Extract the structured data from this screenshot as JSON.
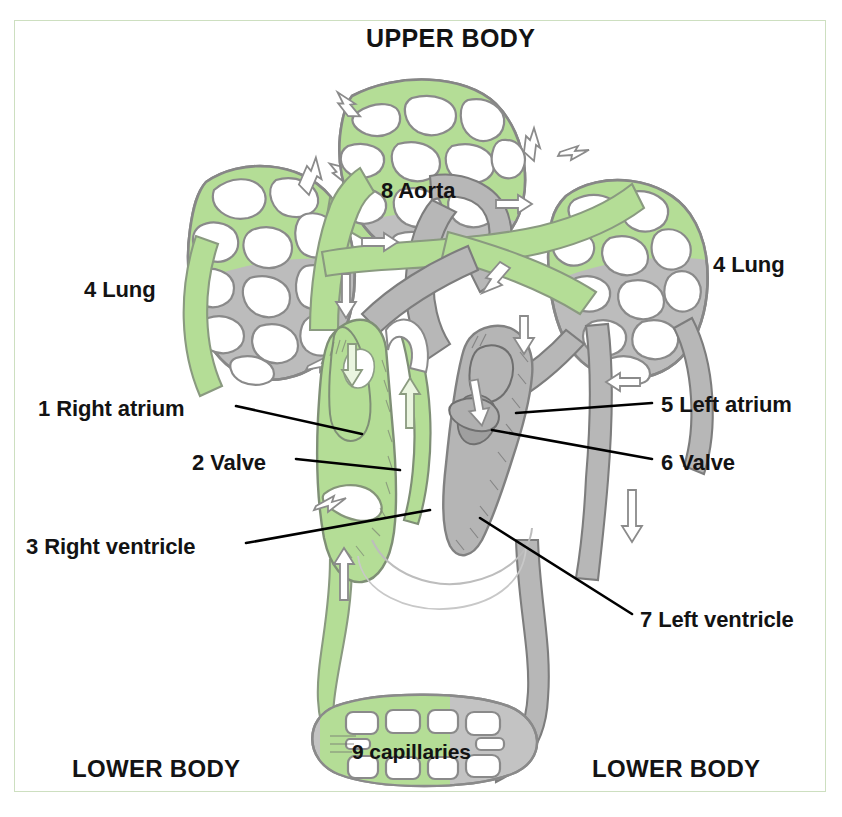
{
  "figure": {
    "background_color": "#ffffff",
    "frame_color": "#cddfc0"
  },
  "colors": {
    "oxygenated": "#aed68e",
    "deoxygenated": "#b0b0b0",
    "outline": "#7a7a7a",
    "text": "#131313",
    "leader_line": "#000000"
  },
  "headings": {
    "upper_body": "UPPER BODY",
    "lower_body_left": "LOWER BODY",
    "lower_body_right": "LOWER BODY"
  },
  "labels": [
    {
      "id": "1",
      "text": "1 Right atrium",
      "number": "1",
      "name": "Right atrium",
      "side": "left",
      "x": 38,
      "y": 396
    },
    {
      "id": "2",
      "text": "2 Valve",
      "number": "2",
      "name": "Valve",
      "side": "left",
      "x": 192,
      "y": 450
    },
    {
      "id": "3",
      "text": "3 Right ventricle",
      "number": "3",
      "name": "Right ventricle",
      "side": "left",
      "x": 26,
      "y": 534
    },
    {
      "id": "4L",
      "text": "4 Lung",
      "number": "4",
      "name": "Lung",
      "side": "left",
      "x": 84,
      "y": 277
    },
    {
      "id": "4R",
      "text": "4 Lung",
      "number": "4",
      "name": "Lung",
      "side": "right",
      "x": 713,
      "y": 252
    },
    {
      "id": "5",
      "text": "5 Left atrium",
      "number": "5",
      "name": "Left atrium",
      "side": "right",
      "x": 661,
      "y": 392
    },
    {
      "id": "6",
      "text": "6 Valve",
      "number": "6",
      "name": "Valve",
      "side": "right",
      "x": 661,
      "y": 450
    },
    {
      "id": "7",
      "text": "7 Left ventricle",
      "number": "7",
      "name": "Left ventricle",
      "side": "right",
      "x": 640,
      "y": 607
    },
    {
      "id": "8",
      "text": "8 Aorta",
      "number": "8",
      "name": "Aorta",
      "side": "center",
      "x": 381,
      "y": 178
    },
    {
      "id": "9",
      "text": "9 capillaries",
      "number": "9",
      "name": "capillaries",
      "side": "center",
      "x": 352,
      "y": 740
    }
  ],
  "diagram_parts": {
    "lungs": [
      "left lung capillary bed",
      "right lung capillary bed",
      "upper body capillary bed"
    ],
    "heart_chambers": [
      "right atrium",
      "right ventricle",
      "left atrium",
      "left ventricle"
    ],
    "valves": [
      "tricuspid valve",
      "mitral valve"
    ],
    "vessels": [
      "aorta",
      "pulmonary artery",
      "pulmonary vein",
      "vena cava"
    ],
    "capillary_beds": [
      "upper body",
      "lower body"
    ]
  }
}
